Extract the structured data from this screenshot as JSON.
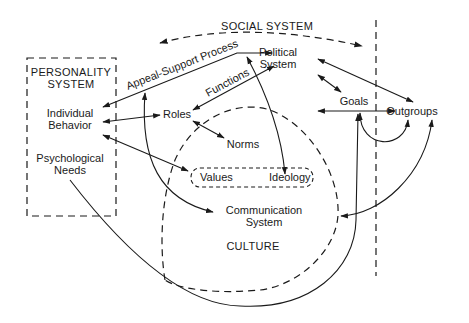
{
  "diagram": {
    "social_system_label": "SOCIAL SYSTEM",
    "personality_system": {
      "title_line1": "PERSONALITY",
      "title_line2": "SYSTEM",
      "individual_behavior_line1": "Individual",
      "individual_behavior_line2": "Behavior",
      "psychological_needs_line1": "Psychological",
      "psychological_needs_line2": "Needs"
    },
    "nodes": {
      "political_system_line1": "Political",
      "political_system_line2": "System",
      "roles": "Roles",
      "norms": "Norms",
      "goals": "Goals",
      "outgroups": "Outgroups",
      "values": "Values",
      "ideology": "Ideology",
      "communication_system_line1": "Communication",
      "communication_system_line2": "System",
      "culture": "CULTURE"
    },
    "edge_labels": {
      "appeal_support_process": "Appeal-Support Process",
      "functions": "Functions"
    }
  }
}
